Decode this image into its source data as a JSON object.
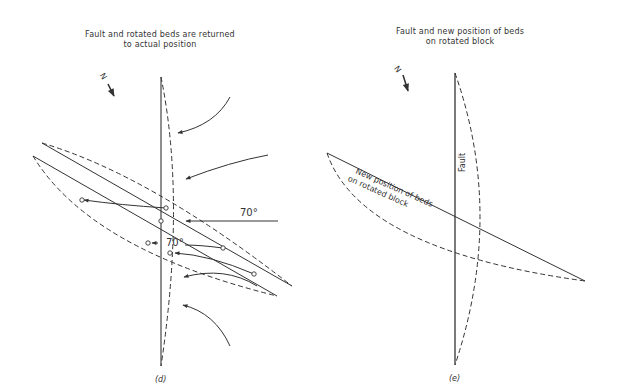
{
  "panel_d": {
    "title_line1": "Fault and rotated beds are returned",
    "title_line2": "to actual position",
    "north_label": "N",
    "angle_label_right": "70°",
    "angle_label_left": "70°",
    "caption": "(d)"
  },
  "panel_e": {
    "title_line1": "Fault and new position of beds",
    "title_line2": "on rotated block",
    "north_label": "N",
    "fault_label": "Fault",
    "beds_label_line1": "New position of beds",
    "beds_label_line2": "on rotated block",
    "caption": "(e)"
  },
  "colors": {
    "line": "#333333",
    "background": "#ffffff"
  }
}
